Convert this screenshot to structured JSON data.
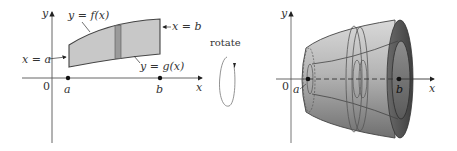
{
  "figure": {
    "left_panel": {
      "axis_labels": {
        "x": "x",
        "y": "y",
        "origin": "0"
      },
      "curve_labels": {
        "upper": "y = f(x)",
        "lower": "y = g(x)",
        "left_bound": "x = a",
        "right_bound": "x = b"
      },
      "points": {
        "a": "a",
        "b": "b"
      }
    },
    "rotate_label": "rotate",
    "right_panel": {
      "axis_labels": {
        "x": "x",
        "y": "y",
        "origin": "0"
      },
      "points": {
        "a": "a",
        "b": "b"
      }
    },
    "colors": {
      "region_fill": "#c8c8c8",
      "strip_fill": "#9a9a9a",
      "outline": "#444444",
      "solid_light": "#bdbdbd",
      "solid_dark": "#5e5e5e"
    }
  }
}
